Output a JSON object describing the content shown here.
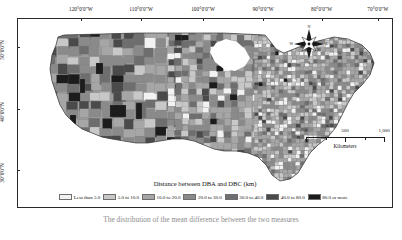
{
  "figure": {
    "legend_title": "Distance between DBA and DBC (km)",
    "caption": "The distribution of the mean difference between the two measures"
  },
  "graticule": {
    "longitude_labels": [
      {
        "text": "120°0'0\"W",
        "x_pct": 17.0
      },
      {
        "text": "110°0'0\"W",
        "x_pct": 33.0
      },
      {
        "text": "100°0'0\"W",
        "x_pct": 49.5
      },
      {
        "text": "90°0'0\"W",
        "x_pct": 65.5
      },
      {
        "text": "80°0'0\"W",
        "x_pct": 81.0
      },
      {
        "text": "70°0'0\"W",
        "x_pct": 96.0
      }
    ],
    "latitude_labels": [
      {
        "text": "50°0'0\"N",
        "y_pct": 15.0
      },
      {
        "text": "40°0'0\"N",
        "y_pct": 48.0
      },
      {
        "text": "30°0'0\"N",
        "y_pct": 80.0
      }
    ]
  },
  "compass": {
    "north": "N",
    "east": "E",
    "south": "S",
    "west": "W"
  },
  "scalebar": {
    "ticks": [
      "0",
      "500",
      "1,000"
    ],
    "units": "Kilometers"
  },
  "chart_data": {
    "type": "choropleth",
    "title": "Distance between DBA and DBC (km)",
    "region": "Contiguous United States (counties)",
    "variable": "Distance between DBA and DBC (km)",
    "color_scheme": "grayscale-sequential",
    "legend_position": "bottom-center",
    "classes": [
      {
        "label": "Less than 5.0",
        "min": 0,
        "max": 5,
        "color": "#f2f2f2"
      },
      {
        "label": "5.0 to 10.0",
        "min": 5,
        "max": 10,
        "color": "#c8c8c8"
      },
      {
        "label": "10.0 to 20.0",
        "min": 10,
        "max": 20,
        "color": "#a6a6a6"
      },
      {
        "label": "20.0 to 30.0",
        "min": 20,
        "max": 30,
        "color": "#8a8a8a"
      },
      {
        "label": "30.0 to 40.0",
        "min": 30,
        "max": 40,
        "color": "#6e6e6e"
      },
      {
        "label": "40.0 to 80.0",
        "min": 40,
        "max": 80,
        "color": "#4a4a4a"
      },
      {
        "label": "80.0 or more",
        "min": 80,
        "max": null,
        "color": "#1c1c1c"
      }
    ],
    "xlabel": "",
    "ylabel": ""
  }
}
